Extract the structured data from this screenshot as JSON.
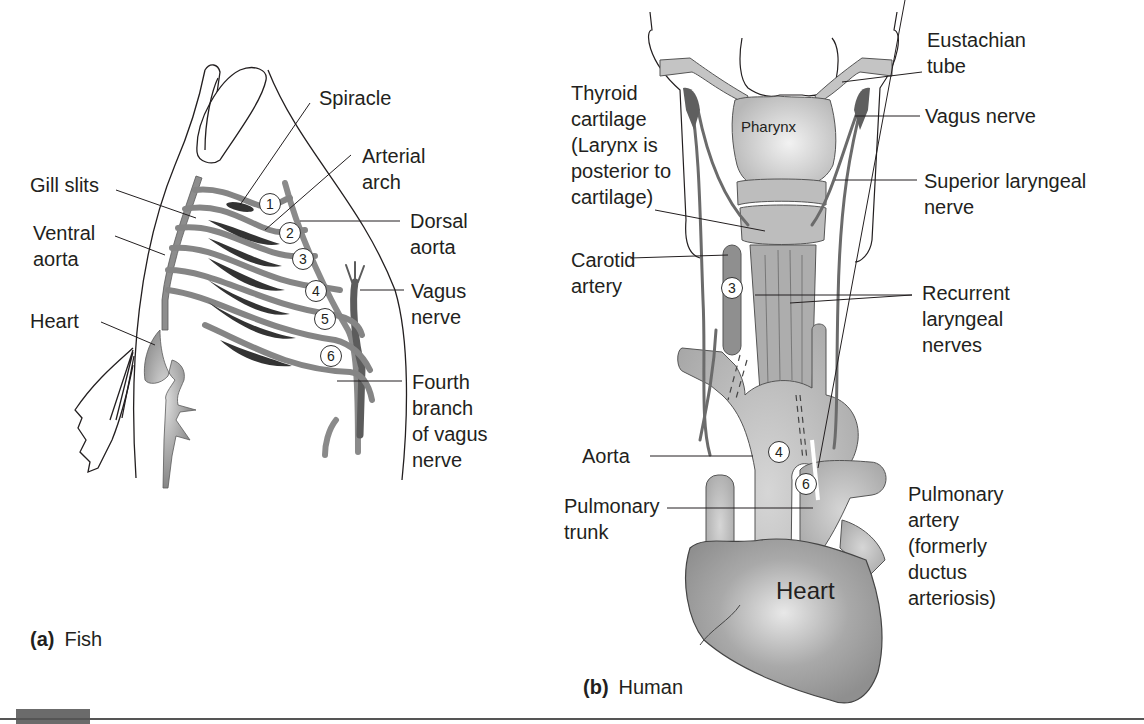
{
  "figure": {
    "panel_a": {
      "letter": "(a)",
      "title": "Fish",
      "labels": {
        "spiracle": [
          "Spiracle"
        ],
        "arterial_arch": [
          "Arterial",
          "arch"
        ],
        "gill_slits": [
          "Gill slits"
        ],
        "dorsal_aorta": [
          "Dorsal",
          "aorta"
        ],
        "ventral_aorta": [
          "Ventral",
          "aorta"
        ],
        "vagus_nerve": [
          "Vagus",
          "nerve"
        ],
        "heart": [
          "Heart"
        ],
        "fourth_branch": [
          "Fourth",
          "branch",
          "of vagus",
          "nerve"
        ]
      },
      "arch_numbers": [
        "1",
        "2",
        "3",
        "4",
        "5",
        "6"
      ]
    },
    "panel_b": {
      "letter": "(b)",
      "title": "Human",
      "labels": {
        "eustachian_tube": [
          "Eustachian",
          "tube"
        ],
        "thyroid_cartilage": [
          "Thyroid",
          "cartilage",
          "(Larynx is",
          "posterior to",
          "cartilage)"
        ],
        "vagus_nerve": [
          "Vagus nerve"
        ],
        "superior_laryngeal": [
          "Superior laryngeal",
          "nerve"
        ],
        "carotid_artery": [
          "Carotid",
          "artery"
        ],
        "recurrent_laryngeal": [
          "Recurrent",
          "laryngeal",
          "nerves"
        ],
        "aorta": [
          "Aorta"
        ],
        "pulmonary_trunk": [
          "Pulmonary",
          "trunk"
        ],
        "pulmonary_artery": [
          "Pulmonary",
          "artery",
          "(formerly",
          "ductus",
          "arteriosis)"
        ]
      },
      "inline_labels": {
        "pharynx": "Pharynx",
        "heart": "Heart"
      },
      "arch_numbers": [
        "3",
        "4",
        "6"
      ]
    },
    "colors": {
      "vessel": "#8a8a8a",
      "vessel_dark": "#5e5e5e",
      "gill": "#3a3a3a",
      "organ_light": "#c9c9c9",
      "line": "#231f20"
    }
  }
}
